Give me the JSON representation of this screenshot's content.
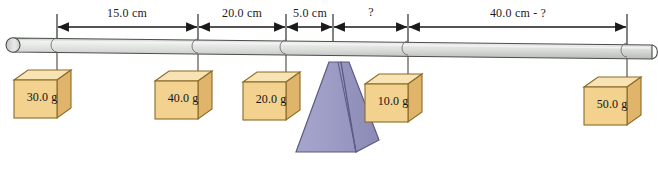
{
  "diagram": {
    "colors": {
      "rod_fill": "#d9dbd9",
      "rod_highlight": "#eceeec",
      "rod_stroke": "#4d4d4d",
      "box_front": "#f2d28e",
      "box_top": "#f8e3b4",
      "box_side": "#e0b46a",
      "box_stroke": "#8a6b28",
      "fulcrum_fill": "#9d9dc6",
      "fulcrum_side": "#8e8eba",
      "fulcrum_stroke": "#5b5b84",
      "dimension_line": "#1a1a1a",
      "string": "#3d3320",
      "background": "#ffffff"
    },
    "dimensions": [
      {
        "label": "15.0 cm",
        "from_x": 57,
        "to_x": 198,
        "center_x": 127,
        "y": 12
      },
      {
        "label": "20.0 cm",
        "from_x": 198,
        "to_x": 286,
        "center_x": 242,
        "y": 12
      },
      {
        "label": "5.0 cm",
        "from_x": 286,
        "to_x": 333,
        "center_x": 310,
        "y": 12
      },
      {
        "label": "?",
        "from_x": 333,
        "to_x": 408,
        "center_x": 371,
        "y": 11
      },
      {
        "label": "40.0 cm - ?",
        "from_x": 408,
        "to_x": 627,
        "center_x": 518,
        "y": 12
      }
    ],
    "masses": [
      {
        "label": "30.0 g",
        "anchor_x": 57,
        "box_center_x": 42,
        "box_center_y": 97
      },
      {
        "label": "40.0 g",
        "anchor_x": 198,
        "box_center_x": 183,
        "box_center_y": 98
      },
      {
        "label": "20.0 g",
        "anchor_x": 286,
        "box_center_x": 271,
        "box_center_y": 99
      },
      {
        "label": "10.0 g",
        "anchor_x": 408,
        "box_center_x": 393,
        "box_center_y": 101
      },
      {
        "label": "50.0 g",
        "anchor_x": 627,
        "box_center_x": 612,
        "box_center_y": 104
      }
    ],
    "fulcrum": {
      "apex_x": 333,
      "base_left_x": 296,
      "base_right_x": 372,
      "top_y": 62,
      "base_y": 152
    },
    "rod": {
      "left_x": 6,
      "right_x": 652,
      "left_y": 45,
      "right_y": 52,
      "thickness": 14
    }
  }
}
